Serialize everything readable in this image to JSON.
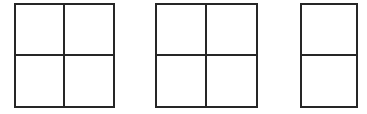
{
  "canvas": {
    "width": 367,
    "height": 114,
    "background_color": "#ffffff",
    "stroke_color": "#262626",
    "stroke_width": 2
  },
  "figures": [
    {
      "id": "figure-1",
      "shape": "rectangle-grid",
      "columns": 2,
      "rows": 2,
      "cell_count": 4,
      "x": 14,
      "y": 3,
      "width": 101,
      "height": 105,
      "vertical_divider_x": 63,
      "horizontal_divider_y": 52,
      "cells": [
        {
          "label": "",
          "row": 1,
          "col": 1
        },
        {
          "label": "",
          "row": 1,
          "col": 2
        },
        {
          "label": "",
          "row": 2,
          "col": 1
        },
        {
          "label": "",
          "row": 2,
          "col": 2
        }
      ]
    },
    {
      "id": "figure-2",
      "shape": "rectangle-grid",
      "columns": 2,
      "rows": 2,
      "cell_count": 4,
      "x": 155,
      "y": 3,
      "width": 103,
      "height": 105,
      "vertical_divider_x": 207,
      "horizontal_divider_y": 52,
      "cells": [
        {
          "label": "",
          "row": 1,
          "col": 1
        },
        {
          "label": "",
          "row": 1,
          "col": 2
        },
        {
          "label": "",
          "row": 2,
          "col": 1
        },
        {
          "label": "",
          "row": 2,
          "col": 2
        }
      ]
    },
    {
      "id": "figure-3",
      "shape": "rectangle-grid",
      "columns": 1,
      "rows": 2,
      "cell_count": 2,
      "x": 300,
      "y": 3,
      "width": 58,
      "height": 105,
      "vertical_divider_x": null,
      "horizontal_divider_y": 52,
      "cells": [
        {
          "label": "",
          "row": 1,
          "col": 1
        },
        {
          "label": "",
          "row": 2,
          "col": 1
        }
      ]
    }
  ]
}
